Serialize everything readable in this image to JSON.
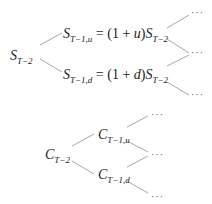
{
  "stock_tree": {
    "root": {
      "symbol": "S",
      "sub": "T−2"
    },
    "up": {
      "symbol": "S",
      "sub": "T−1,u",
      "eq": " = (1 + ",
      "factor": "u",
      "close": ")",
      "tail_symbol": "S",
      "tail_sub": "T−2"
    },
    "down": {
      "symbol": "S",
      "sub": "T−1,d",
      "eq": " = (1 + ",
      "factor": "d",
      "close": ")",
      "tail_symbol": "S",
      "tail_sub": "T−2"
    },
    "continuations": [
      "···",
      "···",
      "···"
    ]
  },
  "option_tree": {
    "root": {
      "symbol": "C",
      "sub": "T−2"
    },
    "up": {
      "symbol": "C",
      "sub": "T−1,u"
    },
    "down": {
      "symbol": "C",
      "sub": "T−1,d"
    },
    "continuations": [
      "···",
      "···",
      "···"
    ]
  },
  "colors": {
    "line": "#a0a0a0",
    "text": "#222222"
  }
}
